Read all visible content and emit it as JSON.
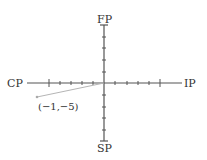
{
  "diagram": {
    "type": "quadrant-axes",
    "axes": {
      "top": "FP",
      "bottom": "SP",
      "left": "CP",
      "right": "IP"
    },
    "ticks_per_half_axis": 5,
    "point": {
      "label": "(−1,−5)",
      "x": -1,
      "y": -5
    },
    "colors": {
      "axis": "#444444",
      "vector": "#b0b0b0",
      "text": "#333333"
    }
  }
}
